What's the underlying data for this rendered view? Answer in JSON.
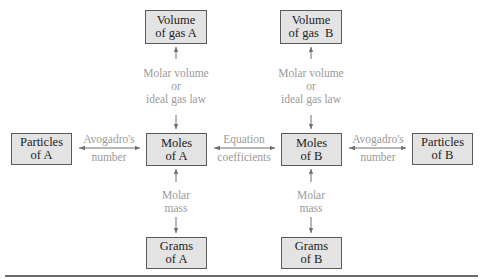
{
  "diagram": {
    "nodes": {
      "volume_a": {
        "line1": "Volume",
        "line2": "of gas A"
      },
      "volume_b": {
        "line1": "Volume",
        "line2": "of gas  B"
      },
      "particles_a": {
        "line1": "Particles",
        "line2": "of A"
      },
      "moles_a": {
        "line1": "Moles",
        "line2": "of A"
      },
      "moles_b": {
        "line1": "Moles",
        "line2": "of B"
      },
      "particles_b": {
        "line1": "Particles",
        "line2": "of B"
      },
      "grams_a": {
        "line1": "Grams",
        "line2": "of A"
      },
      "grams_b": {
        "line1": "Grams",
        "line2": "of B"
      }
    },
    "edges": {
      "volume_moles_a": {
        "line1": "Molar volume",
        "line2": "or",
        "line3": "ideal gas law"
      },
      "volume_moles_b": {
        "line1": "Molar volume",
        "line2": "or",
        "line3": "ideal gas law"
      },
      "particles_moles_a": {
        "line1": "Avogadro's",
        "line2": "number"
      },
      "moles_a_moles_b": {
        "line1": "Equation",
        "line2": "coefficients"
      },
      "moles_particles_b": {
        "line1": "Avogadro's",
        "line2": "number"
      },
      "moles_grams_a": {
        "line1": "Molar",
        "line2": "mass"
      },
      "moles_grams_b": {
        "line1": "Molar",
        "line2": "mass"
      }
    },
    "colors": {
      "box_fill": "#e3e3e3",
      "box_border": "#5a5a5a",
      "label_text": "#9a9a9a",
      "arrow": "#707070"
    }
  }
}
